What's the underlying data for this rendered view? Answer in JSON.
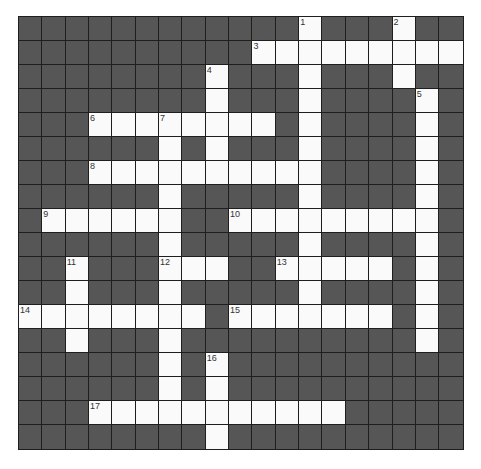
{
  "crossword": {
    "cols": 19,
    "rows": 18,
    "colors": {
      "block": "#565656",
      "open": "#fafafa",
      "grid_line": "#1e1e1e",
      "number": "#333333"
    },
    "grid": [
      "............#...#..",
      "..........#########",
      "........#...#...#..",
      "........#...#....#.",
      "...########.#....#.",
      "......#.#...#....#.",
      "...##########....#.",
      "......#.....#....#.",
      ".######..#########.",
      "......#.....#....#.",
      "..#...###..#####.#.",
      "..#...#.....#....#.",
      "########.#######.#.",
      "..#...#..........#.",
      "......#.#..........",
      "......#.#..........",
      "...###########.....",
      "........#.........."
    ],
    "numbers": [
      {
        "n": "1",
        "row": 0,
        "col": 12
      },
      {
        "n": "2",
        "row": 0,
        "col": 16
      },
      {
        "n": "3",
        "row": 1,
        "col": 10
      },
      {
        "n": "4",
        "row": 2,
        "col": 8
      },
      {
        "n": "5",
        "row": 3,
        "col": 17
      },
      {
        "n": "6",
        "row": 4,
        "col": 3
      },
      {
        "n": "7",
        "row": 4,
        "col": 6
      },
      {
        "n": "8",
        "row": 6,
        "col": 3
      },
      {
        "n": "9",
        "row": 8,
        "col": 1
      },
      {
        "n": "10",
        "row": 8,
        "col": 9
      },
      {
        "n": "11",
        "row": 10,
        "col": 2
      },
      {
        "n": "12",
        "row": 10,
        "col": 6
      },
      {
        "n": "13",
        "row": 10,
        "col": 11
      },
      {
        "n": "14",
        "row": 12,
        "col": 0
      },
      {
        "n": "15",
        "row": 12,
        "col": 9
      },
      {
        "n": "16",
        "row": 14,
        "col": 8
      },
      {
        "n": "17",
        "row": 16,
        "col": 3
      }
    ]
  }
}
